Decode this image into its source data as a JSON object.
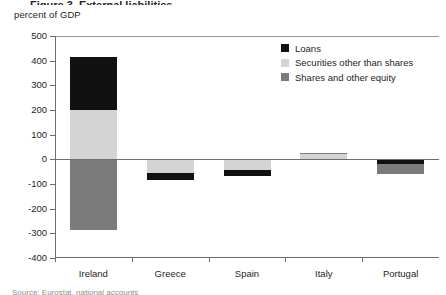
{
  "figure": {
    "title_sliver": "Figure 3. External liabilities",
    "caption_sliver": "Source: Eurostat, national accounts"
  },
  "legend": {
    "position": "top-right",
    "items": [
      {
        "label": "Loans",
        "color": "#111111"
      },
      {
        "label": "Securities other than shares",
        "color": "#d4d4d4"
      },
      {
        "label": "Shares and other equity",
        "color": "#7b7b7b"
      }
    ]
  },
  "chart_data": {
    "type": "bar",
    "stacked": true,
    "title": "",
    "subtitle": "",
    "xlabel": "",
    "ylabel": "percent of GDP",
    "ylim": [
      -400,
      500
    ],
    "yticks": [
      500,
      400,
      300,
      200,
      100,
      0,
      -100,
      -200,
      -300,
      -400
    ],
    "ytick_labels": [
      "500",
      "400",
      "300",
      "200",
      "100",
      "0",
      "-100",
      "-200",
      "-300",
      "-400"
    ],
    "grid": false,
    "categories": [
      "Ireland",
      "Greece",
      "Spain",
      "Italy",
      "Portugal"
    ],
    "series": [
      {
        "name": "Loans",
        "color": "#111111",
        "values": [
          215,
          -30,
          -22,
          0,
          -20
        ]
      },
      {
        "name": "Securities other than shares",
        "color": "#d4d4d4",
        "values": [
          200,
          -55,
          -45,
          20,
          0
        ]
      },
      {
        "name": "Shares and other equity",
        "color": "#7b7b7b",
        "values": [
          -285,
          0,
          0,
          5,
          -40
        ]
      }
    ],
    "bars": [
      {
        "category": "Ireland",
        "segments": [
          {
            "series": "Loans",
            "from": 200,
            "to": 415,
            "color": "#111111"
          },
          {
            "series": "Securities other than shares",
            "from": 0,
            "to": 200,
            "color": "#d4d4d4"
          },
          {
            "series": "Shares and other equity",
            "from": -285,
            "to": 0,
            "color": "#7b7b7b"
          }
        ]
      },
      {
        "category": "Greece",
        "segments": [
          {
            "series": "Securities other than shares",
            "from": -55,
            "to": 0,
            "color": "#d4d4d4"
          },
          {
            "series": "Loans",
            "from": -85,
            "to": -55,
            "color": "#111111"
          }
        ]
      },
      {
        "category": "Spain",
        "segments": [
          {
            "series": "Securities other than shares",
            "from": -45,
            "to": 0,
            "color": "#d4d4d4"
          },
          {
            "series": "Loans",
            "from": -67,
            "to": -45,
            "color": "#111111"
          }
        ]
      },
      {
        "category": "Italy",
        "segments": [
          {
            "series": "Shares and other equity",
            "from": 20,
            "to": 27,
            "color": "#7b7b7b"
          },
          {
            "series": "Securities other than shares",
            "from": 0,
            "to": 20,
            "color": "#d4d4d4"
          }
        ]
      },
      {
        "category": "Portugal",
        "segments": [
          {
            "series": "Loans",
            "from": -20,
            "to": 0,
            "color": "#111111"
          },
          {
            "series": "Shares and other equity",
            "from": -60,
            "to": -20,
            "color": "#7b7b7b"
          }
        ]
      }
    ]
  }
}
